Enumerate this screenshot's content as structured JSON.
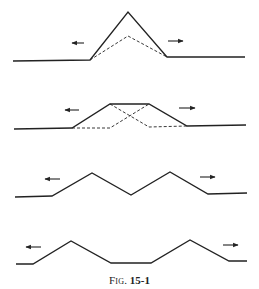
{
  "figure": {
    "caption_prefix": "Fig.",
    "caption_number": "15-1",
    "stroke_color": "#222222",
    "panels": [
      {
        "id": "panel-1",
        "solid": [
          [
            13,
            61
          ],
          [
            90,
            60
          ],
          [
            128,
            12
          ],
          [
            167,
            57
          ],
          [
            245,
            57
          ]
        ],
        "dashed": [
          [
            [
              90,
              60
            ],
            [
              128,
              36
            ],
            [
              167,
              57
            ]
          ]
        ],
        "arrow_left": {
          "x1": 84,
          "x2": 72,
          "y": 43
        },
        "arrow_right": {
          "x1": 168,
          "x2": 183,
          "y": 41
        }
      },
      {
        "id": "panel-2",
        "solid": [
          [
            14,
            129
          ],
          [
            72,
            128
          ],
          [
            110,
            104
          ],
          [
            149,
            104
          ],
          [
            187,
            126
          ],
          [
            246,
            125
          ]
        ],
        "dashed": [
          [
            [
              72,
              128
            ],
            [
              110,
              128
            ],
            [
              149,
              104
            ]
          ],
          [
            [
              110,
              104
            ],
            [
              149,
              127
            ],
            [
              187,
              126
            ]
          ]
        ],
        "arrow_left": {
          "x1": 79,
          "x2": 65,
          "y": 110
        },
        "arrow_right": {
          "x1": 179,
          "x2": 195,
          "y": 108
        }
      },
      {
        "id": "panel-3",
        "solid": [
          [
            15,
            197
          ],
          [
            52,
            196
          ],
          [
            92,
            173
          ],
          [
            131,
            195
          ],
          [
            170,
            172
          ],
          [
            208,
            194
          ],
          [
            247,
            193
          ]
        ],
        "dashed": [],
        "arrow_left": {
          "x1": 60,
          "x2": 45,
          "y": 179
        },
        "arrow_right": {
          "x1": 200,
          "x2": 215,
          "y": 177
        }
      },
      {
        "id": "panel-4",
        "solid": [
          [
            16,
            264
          ],
          [
            33,
            264
          ],
          [
            71,
            241
          ],
          [
            111,
            263
          ],
          [
            151,
            263
          ],
          [
            190,
            240
          ],
          [
            229,
            261
          ],
          [
            247,
            261
          ]
        ],
        "dashed": [],
        "arrow_left": {
          "x1": 41,
          "x2": 26,
          "y": 247
        },
        "arrow_right": {
          "x1": 223,
          "x2": 238,
          "y": 245
        }
      }
    ]
  }
}
